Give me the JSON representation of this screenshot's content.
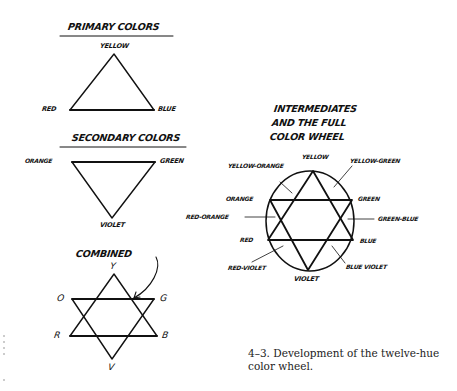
{
  "primary": {
    "title": "PRIMARY COLORS",
    "labels": {
      "top": "YELLOW",
      "left": "RED",
      "right": "BLUE"
    }
  },
  "secondary": {
    "title": "SECONDARY COLORS",
    "labels": {
      "left": "ORANGE",
      "right": "GREEN",
      "bottom": "VIOLET"
    }
  },
  "combined": {
    "title": "COMBINED",
    "labels": {
      "y": "Y",
      "o": "O",
      "g": "G",
      "r": "R",
      "b": "B",
      "v": "V"
    }
  },
  "wheel": {
    "title_lines": [
      "INTERMEDIATES",
      "AND THE FULL",
      "COLOR WHEEL"
    ],
    "labels": {
      "yellow": "YELLOW",
      "yellow_orange": "YELLOW-ORANGE",
      "yellow_green": "YELLOW-GREEN",
      "orange": "ORANGE",
      "green": "GREEN",
      "red_orange": "RED-ORANGE",
      "green_blue": "GREEN-BLUE",
      "red": "RED",
      "blue": "BLUE",
      "red_violet": "RED-VIOLET",
      "blue_violet": "BLUE VIOLET",
      "violet": "VIOLET"
    }
  },
  "caption": {
    "line1": "4–3. Development of the twelve-hue",
    "line2": "color wheel."
  },
  "colors": {
    "ink": "#111111",
    "background": "#ffffff"
  }
}
